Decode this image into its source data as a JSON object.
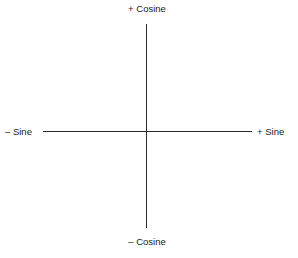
{
  "diagram": {
    "type": "quadrant-axes",
    "labels": {
      "top": "+ Cosine",
      "bottom": "– Cosine",
      "left": "– Sine",
      "right": "+ Sine"
    },
    "colors": {
      "line": "#2a2a2a",
      "text": "#1a1a1a",
      "background": "#ffffff"
    }
  }
}
